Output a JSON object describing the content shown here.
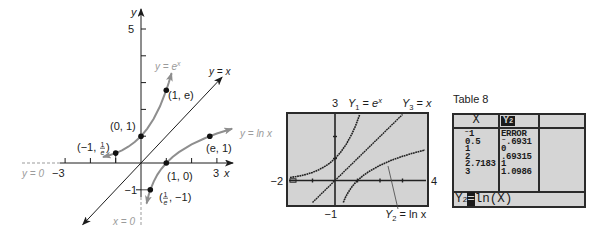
{
  "colors": {
    "curve_gray": "#8e8e8e",
    "ink": "#1c1c1c",
    "calc_screen": "#d3d3d3",
    "calc_ink": "#222222"
  },
  "left_graph": {
    "axis_labels": {
      "x": "x",
      "y": "y"
    },
    "tick_labels": {
      "y_5": "5",
      "y_neg1": "−1",
      "x_neg3": "−3",
      "x_3": "3"
    },
    "asymptote_labels": {
      "horizontal": "y = 0",
      "vertical": "x = 0"
    },
    "curve_labels": {
      "exp": {
        "base": "y = e",
        "sup": "x"
      },
      "identity": "y = x",
      "log": "y = ln x"
    },
    "point_labels": {
      "p_1_e": "(1, e)",
      "p_0_1": "(0, 1)",
      "p_e_1": "(e, 1)",
      "p_1_0": "(1, 0)",
      "p_neg1_inv_e": {
        "open": "(−1, ",
        "num": "1",
        "den": "e",
        "close": ")"
      },
      "p_inv_e_neg1": {
        "open": "(",
        "num": "1",
        "den": "e",
        "close": ", −1)"
      }
    }
  },
  "calculator_graph": {
    "window_labels": {
      "ymax": "3",
      "xmin": "−2",
      "xmax": "4",
      "ymin": "−1"
    },
    "legend": {
      "y1": {
        "name": "Y",
        "sub": "1",
        "eq": " = ",
        "base": "e",
        "sup": "x"
      },
      "y3": {
        "name": "Y",
        "sub": "3",
        "eq": " = ",
        "expr": "x"
      },
      "y2": {
        "name": "Y",
        "sub": "2",
        "eq": " = ",
        "expr": "ln x"
      }
    }
  },
  "table": {
    "title": "Table 8",
    "headers": [
      "X",
      {
        "name": "Y",
        "sub": "2"
      }
    ],
    "rows": [
      {
        "x": "⁻1",
        "y2": "ERROR"
      },
      {
        "x": "0.5",
        "y2": "⁻.6931"
      },
      {
        "x": "1",
        "y2": "0"
      },
      {
        "x": "2",
        "y2": ".69315"
      },
      {
        "x": "2.7183",
        "y2": "1"
      },
      {
        "x": "3",
        "y2": "1.0986"
      }
    ],
    "formula": {
      "name": "Y",
      "sub": "2",
      "cursor": "=",
      "expr": "ln(X)"
    }
  },
  "chart_data": [
    {
      "type": "line",
      "title": "",
      "xlabel": "x",
      "ylabel": "y",
      "xlim": [
        -3.3,
        3.6
      ],
      "ylim": [
        -2.3,
        5.5
      ],
      "grid": false,
      "x_ticks": [
        -3,
        -2,
        -1,
        1,
        2,
        3
      ],
      "y_ticks": [
        -1,
        1,
        2,
        3,
        4,
        5
      ],
      "asymptotes": [
        "y = 0",
        "x = 0"
      ],
      "series": [
        {
          "name": "y = e^x",
          "color": "#8e8e8e",
          "width": 2,
          "x": [
            -1.5,
            -1.25,
            -1,
            -0.75,
            -0.5,
            -0.25,
            0,
            0.25,
            0.5,
            0.75,
            1,
            1.1,
            1.21
          ],
          "y": [
            0.223,
            0.287,
            0.368,
            0.472,
            0.607,
            0.779,
            1,
            1.284,
            1.649,
            2.117,
            2.718,
            3.004,
            3.353
          ]
        },
        {
          "name": "y = ln x",
          "color": "#8e8e8e",
          "width": 2,
          "x": [
            0.22,
            0.3,
            0.368,
            0.5,
            0.65,
            0.8,
            1,
            1.25,
            1.5,
            2,
            2.5,
            2.718,
            3,
            3.6
          ],
          "y": [
            -1.514,
            -1.204,
            -1,
            -0.693,
            -0.431,
            -0.223,
            0,
            0.223,
            0.405,
            0.693,
            0.916,
            1,
            1.099,
            1.281
          ]
        },
        {
          "name": "y = x",
          "color": "#1c1c1c",
          "width": 1,
          "x": [
            -2.3,
            3.2
          ],
          "y": [
            -2.3,
            3.2
          ]
        }
      ],
      "points": [
        {
          "x": -1,
          "y": 0.368,
          "label": "(−1, 1/e)"
        },
        {
          "x": 0,
          "y": 1,
          "label": "(0, 1)"
        },
        {
          "x": 1,
          "y": 2.718,
          "label": "(1, e)"
        },
        {
          "x": 1,
          "y": 0,
          "label": "(1, 0)"
        },
        {
          "x": 2.718,
          "y": 1,
          "label": "(e, 1)"
        },
        {
          "x": 0.368,
          "y": -1,
          "label": "(1/e, −1)"
        }
      ]
    },
    {
      "type": "line",
      "title": "Graphing calculator window",
      "xlabel": "",
      "ylabel": "",
      "xlim": [
        -2,
        4
      ],
      "ylim": [
        -1,
        3
      ],
      "x_ticks": [
        -1,
        1,
        2,
        3
      ],
      "y_ticks": [
        1,
        2
      ],
      "series": [
        {
          "name": "Y1 = e^x",
          "color": "#222222",
          "width": 1.6,
          "x": [
            -2,
            -1.75,
            -1.5,
            -1.25,
            -1,
            -0.75,
            -0.5,
            -0.25,
            0,
            0.25,
            0.5,
            0.75,
            0.9,
            1.0986
          ],
          "y": [
            0.135,
            0.174,
            0.223,
            0.287,
            0.368,
            0.472,
            0.607,
            0.779,
            1,
            1.284,
            1.649,
            2.117,
            2.46,
            3
          ]
        },
        {
          "name": "Y2 = ln x",
          "color": "#222222",
          "width": 1.6,
          "x": [
            0.368,
            0.45,
            0.55,
            0.7,
            0.85,
            1,
            1.25,
            1.5,
            2,
            2.5,
            3,
            3.5,
            4
          ],
          "y": [
            -1,
            -0.799,
            -0.598,
            -0.357,
            -0.163,
            0,
            0.223,
            0.405,
            0.693,
            0.916,
            1.099,
            1.253,
            1.386
          ]
        },
        {
          "name": "Y3 = x",
          "color": "#222222",
          "width": 1.4,
          "x": [
            -1,
            3
          ],
          "y": [
            -1,
            3
          ]
        }
      ]
    },
    {
      "type": "table",
      "title": "Table 8",
      "columns": [
        "X",
        "Y2"
      ],
      "rows": [
        [
          "-1",
          "ERROR"
        ],
        [
          "0.5",
          "-.6931"
        ],
        [
          "1",
          "0"
        ],
        [
          "2",
          ".69315"
        ],
        [
          "2.7183",
          "1"
        ],
        [
          "3",
          "1.0986"
        ]
      ],
      "formula": "Y2=ln(X)"
    }
  ]
}
